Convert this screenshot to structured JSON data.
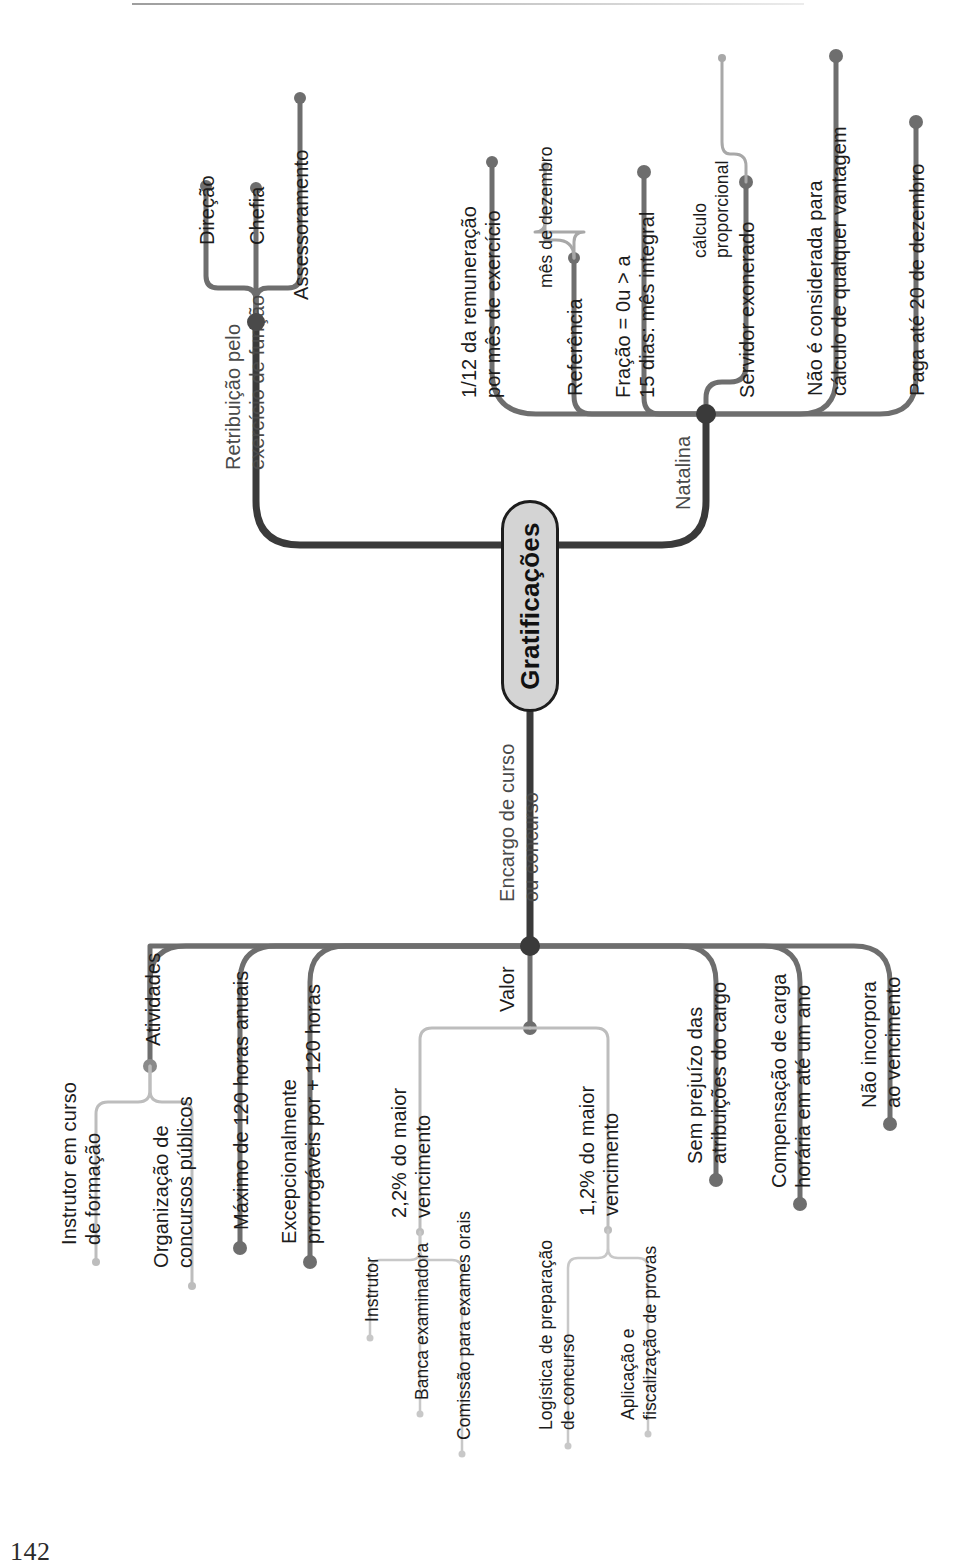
{
  "page": {
    "number": "142",
    "title": "Gratificações"
  },
  "root": {
    "label": "Gratificações"
  },
  "branches": [
    {
      "id": "retribuicao",
      "label": "Retribuição pelo\nexercício de função",
      "label_line1": "Retribuição pelo",
      "label_line2": "exercício de função",
      "children": [
        {
          "label": "Direção"
        },
        {
          "label": "Chefia"
        },
        {
          "label": "Assessoramento"
        }
      ]
    },
    {
      "id": "natalina",
      "label": "Natalina",
      "children": [
        {
          "label": "1/12 da remuneração\npor mês de exercício"
        },
        {
          "label": "Referência",
          "children": [
            {
              "label": "mês de dezembro"
            }
          ]
        },
        {
          "label": "Fração = 0u > a\n15 dias: mês integral"
        },
        {
          "label": "Servidor exonerado",
          "children": [
            {
              "label": "cálculo\nproporcional"
            }
          ]
        },
        {
          "label": "Não é considerada para\ncálculo de qualquer vantagem"
        },
        {
          "label": "Paga até 20 de dezembro"
        }
      ]
    },
    {
      "id": "encargo",
      "label": "Encargo de curso\nou concurso",
      "label_line1": "Encargo de curso",
      "label_line2": "ou concurso",
      "children": [
        {
          "label": "Atividades",
          "children": [
            {
              "label": "Instrutor em curso\nde formação"
            },
            {
              "label": "Organização de\nconcursos públicos"
            }
          ]
        },
        {
          "label": "Máximo de 120 horas anuais"
        },
        {
          "label": "Excepcionalmente\nprorrogáveis por + 120 horas"
        },
        {
          "label": "Valor",
          "children": [
            {
              "label": "2,2% do maior\nvencimento",
              "children": [
                {
                  "label": "Instrutor"
                },
                {
                  "label": "Banca examinadora"
                },
                {
                  "label": "Comissão para exames orais"
                }
              ]
            },
            {
              "label": "1,2% do maior\nvencimento",
              "children": [
                {
                  "label": "Logística de preparação\nde concurso"
                },
                {
                  "label": "Aplicação e\nfiscalização de provas"
                }
              ]
            }
          ]
        },
        {
          "label": "Sem prejuízo das\natribuições do cargo"
        },
        {
          "label": "Compensação de carga\nhorária em até um ano"
        },
        {
          "label": "Não incorpora\nao vencimento"
        }
      ]
    }
  ],
  "text": {
    "direcao": "Direção",
    "chefia": "Chefia",
    "assessoramento": "Assessoramento",
    "retribuicao_l1": "Retribuição pelo",
    "retribuicao_l2": "exercício de função",
    "natalina": "Natalina",
    "umdozeavos_l1": "1/12 da remuneração",
    "umdozeavos_l2": "por mês de exercício",
    "referencia": "Referência",
    "mes_dezembro": "mês de dezembro",
    "fracao_l1": "Fração = 0u > a",
    "fracao_l2": "15 dias: mês integral",
    "servidor_exonerado": "Servidor exonerado",
    "calculo_l1": "cálculo",
    "calculo_l2": "proporcional",
    "nao_considerada_l1": "Não é considerada para",
    "nao_considerada_l2": "cálculo de qualquer vantagem",
    "paga_ate": "Paga até 20 de dezembro",
    "encargo_l1": "Encargo de curso",
    "encargo_l2": "ou concurso",
    "atividades": "Atividades",
    "instrutor_curso_l1": "Instrutor em curso",
    "instrutor_curso_l2": "de formação",
    "organizacao_l1": "Organização de",
    "organizacao_l2": "concursos públicos",
    "maximo_120": "Máximo de 120 horas anuais",
    "excepcionalmente_l1": "Excepcionalmente",
    "excepcionalmente_l2": "prorrogáveis por + 120 horas",
    "valor": "Valor",
    "dois_virgula_dois_l1": "2,2% do maior",
    "dois_virgula_dois_l2": "vencimento",
    "instrutor": "Instrutor",
    "banca": "Banca examinadora",
    "comissao": "Comissão para exames orais",
    "um_virgula_dois_l1": "1,2% do maior",
    "um_virgula_dois_l2": "vencimento",
    "logistica_l1": "Logística de preparação",
    "logistica_l2": "de concurso",
    "aplicacao_l1": "Aplicação e",
    "aplicacao_l2": "fiscalização de provas",
    "sem_prejuizo_l1": "Sem prejuízo das",
    "sem_prejuizo_l2": "atribuições do cargo",
    "compensacao_l1": "Compensação de carga",
    "compensacao_l2": "horária em até um ano",
    "nao_incorpora_l1": "Não incorpora",
    "nao_incorpora_l2": "ao vencimento"
  },
  "colors": {
    "root_fill": "#d4d4d4",
    "root_stroke": "#1d1d1d",
    "trunk": "#3a3a3a",
    "branch": "#6e6e6e",
    "twig": "#a8a8a8",
    "text": "#1c1c1c",
    "text_muted": "#4a4a4a",
    "background": "#ffffff"
  }
}
